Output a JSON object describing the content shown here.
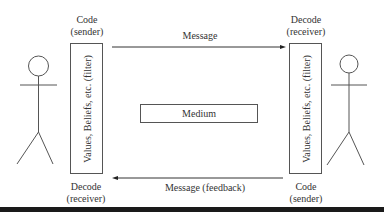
{
  "diagram": {
    "left": {
      "top_label_line1": "Code",
      "top_label_line2": "(sender)",
      "filter_label": "Values, Beliefs, etc. (filter)",
      "bottom_label_line1": "Decode",
      "bottom_label_line2": "(receiver)"
    },
    "right": {
      "top_label_line1": "Decode",
      "top_label_line2": "(receiver)",
      "filter_label": "Values, Beliefs, etc. (filter)",
      "bottom_label_line1": "Code",
      "bottom_label_line2": "(sender)"
    },
    "top_arrow": {
      "label": "Message",
      "direction": "left-to-right"
    },
    "bottom_arrow": {
      "label": "Message (feedback)",
      "direction": "right-to-left"
    },
    "medium": {
      "label": "Medium"
    },
    "figures": [
      "stick-figure-left",
      "stick-figure-right"
    ],
    "colors": {
      "line": "#444444",
      "text": "#333333",
      "bar": "#1a1a1a"
    }
  }
}
